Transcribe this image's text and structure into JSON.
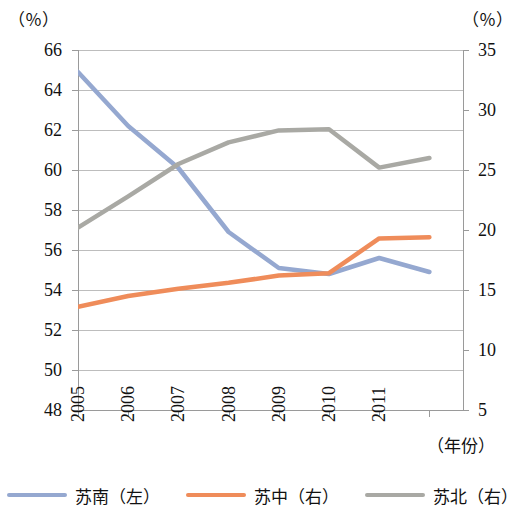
{
  "axes": {
    "left_unit": "（％）",
    "right_unit": "（％）",
    "xaxis_title": "（年份）",
    "left_ticks": [
      "66",
      "64",
      "62",
      "60",
      "58",
      "56",
      "54",
      "52",
      "50",
      "48"
    ],
    "right_ticks": [
      "35",
      "30",
      "25",
      "20",
      "15",
      "10",
      "5"
    ],
    "x_ticks": [
      "2005",
      "2006",
      "2007",
      "2008",
      "2009",
      "2010",
      "2011"
    ]
  },
  "legend": {
    "items": [
      {
        "label": "苏南（左）",
        "color": "#95a8d0"
      },
      {
        "label": "苏中（右）",
        "color": "#ef8c5a"
      },
      {
        "label": "苏北（右）",
        "color": "#a9a9a4"
      }
    ]
  },
  "chart_data": {
    "type": "line",
    "title": "",
    "xlabel": "（年份）",
    "ylabel": "（％）",
    "y2label": "（％）",
    "grid": true,
    "legend_position": "bottom",
    "categories": [
      "2005",
      "2006",
      "2007",
      "2008",
      "2009",
      "2010",
      "2011"
    ],
    "ylim": [
      48,
      66
    ],
    "y2lim": [
      5,
      35
    ],
    "ytick_step": 2,
    "y2tick_step": 5,
    "series": [
      {
        "name": "苏南（左）",
        "axis": "left",
        "color": "#95a8d0",
        "values": [
          64.9,
          62.2,
          60.1,
          56.9,
          55.1,
          54.8,
          55.6
        ],
        "trailing_value": 54.9
      },
      {
        "name": "苏中（右）",
        "axis": "right",
        "color": "#ef8c5a",
        "values": [
          13.6,
          14.5,
          15.1,
          15.6,
          16.2,
          16.4,
          19.3
        ],
        "trailing_value": 19.4
      },
      {
        "name": "苏北（右）",
        "axis": "right",
        "color": "#a9a9a4",
        "values": [
          20.2,
          22.8,
          25.5,
          27.3,
          28.3,
          28.4,
          25.2
        ],
        "trailing_value": 26.0
      }
    ]
  }
}
